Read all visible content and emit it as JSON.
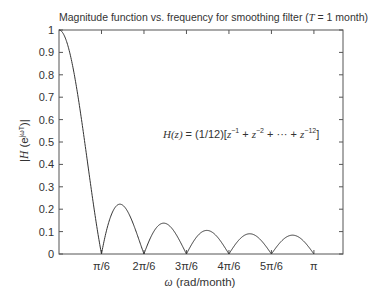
{
  "chart_data": {
    "type": "line",
    "title": "Magnitude function vs. frequency for smoothing filter (T = 1 month)",
    "title_parts": {
      "prefix": "Magnitude function vs. frequency for smoothing filter (",
      "var": "T",
      "suffix": " = 1 month)"
    },
    "xlabel": "ω (rad/month)",
    "xlabel_parts": {
      "var": "ω",
      "rest": " (rad/month)"
    },
    "ylabel": "|H(e^{jωT})|",
    "ylabel_parts": {
      "pre": "|",
      "var": "H",
      "mid": " (e",
      "sup": "jωT",
      "post": ")|"
    },
    "annotation": "H(z) = (1/12)[z^-1 + z^-2 + ··· + z^-12]",
    "annotation_parts": {
      "lhs": "H(z)",
      "rhs": " = (1/12)[",
      "z": "z",
      "e1": "−1",
      "e2": "−2",
      "dots": " + ··· + ",
      "e12": "−12",
      "close": "]",
      "plus": " + "
    },
    "xticks": [
      {
        "label": "π/6",
        "value": 0.5236
      },
      {
        "label": "2π/6",
        "value": 1.0472
      },
      {
        "label": "3π/6",
        "value": 1.5708
      },
      {
        "label": "4π/6",
        "value": 2.0944
      },
      {
        "label": "5π/6",
        "value": 2.618
      },
      {
        "label": "π",
        "value": 3.1416
      }
    ],
    "yticks": [
      "0",
      "0.1",
      "0.2",
      "0.3",
      "0.4",
      "0.5",
      "0.6",
      "0.7",
      "0.8",
      "0.9",
      "1"
    ],
    "xlim": [
      0,
      3.5
    ],
    "ylim": [
      0,
      1
    ],
    "grid": false,
    "legend": null,
    "series": [
      {
        "name": "|H(e^{jωT})|",
        "formula": "|sin(6ω) / (12 sin(ω/2))|",
        "x": [
          0,
          0.1,
          0.2,
          0.3,
          0.4,
          0.5236,
          0.6,
          0.7854,
          0.95,
          1.0472,
          1.2,
          1.309,
          1.45,
          1.5708,
          1.7,
          1.8326,
          1.95,
          2.0944,
          2.2,
          2.3562,
          2.5,
          2.618,
          2.75,
          2.8798,
          3.0,
          3.1416
        ],
        "y": [
          1.0,
          0.94,
          0.78,
          0.55,
          0.3,
          0.0,
          0.14,
          0.22,
          0.12,
          0.0,
          0.12,
          0.14,
          0.08,
          0.0,
          0.09,
          0.1,
          0.07,
          0.0,
          0.06,
          0.09,
          0.06,
          0.0,
          0.06,
          0.085,
          0.06,
          0.0
        ]
      }
    ],
    "colors": {
      "line": "#333333",
      "axes": "#555555",
      "background": "#ffffff"
    }
  }
}
